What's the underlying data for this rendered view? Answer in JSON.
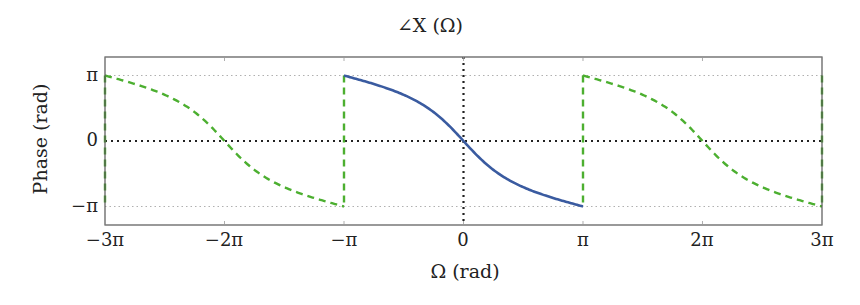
{
  "chart_data": {
    "type": "line",
    "title": "∠X (Ω)",
    "xlabel": "Ω (rad)",
    "ylabel": "Phase (rad)",
    "xlim": [
      -9.4248,
      9.4248
    ],
    "ylim": [
      -3.6,
      3.6
    ],
    "x_ticks": [
      "−3π",
      "−2π",
      "−π",
      "0",
      "π",
      "2π",
      "3π"
    ],
    "y_ticks": [
      "π",
      "0",
      "−π"
    ],
    "grid": "dotted lines at y = ±π, y = 0 and x = 0",
    "series": [
      {
        "name": "principal period (−π to π)",
        "style": "solid",
        "color": "#3a5ba0",
        "formula": "φ(Ω) = −2·atan(2·tan(Ω/2))",
        "x": [
          -3.1416,
          -2.3562,
          -1.5708,
          -0.7854,
          0,
          0.7854,
          1.5708,
          2.3562,
          3.1416
        ],
        "y": [
          3.1416,
          2.7468,
          2.2143,
          1.3903,
          0,
          -1.3903,
          -2.2143,
          -2.7468,
          -3.1416
        ]
      },
      {
        "name": "periodic repetitions",
        "style": "dashed",
        "color": "#4caf30",
        "x_ranges": [
          [
            -9.4248,
            -3.1416
          ],
          [
            3.1416,
            9.4248
          ]
        ],
        "note": "same shape repeated with period 2π; zero crossings at ±2π, vertical jumps at ±π"
      }
    ]
  },
  "colors": {
    "blue": "#3a5ba0",
    "green": "#4caf30",
    "grid": "#222222",
    "faint_grid": "#b0b0b0",
    "frame": "#555555"
  }
}
